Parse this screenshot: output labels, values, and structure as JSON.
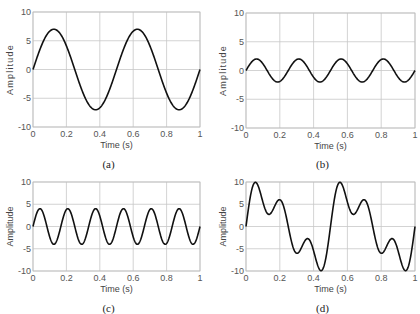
{
  "chart_data": [
    {
      "type": "line",
      "panel": "(a)",
      "caption": "(a)",
      "xlabel": "Time (s)",
      "ylabel": "Amplitude",
      "xlim": [
        0,
        1
      ],
      "ylim": [
        -10,
        10
      ],
      "xticks": [
        "0",
        "0.2",
        "0.4",
        "0.6",
        "0.8",
        "1"
      ],
      "yticks": [
        "10",
        "5",
        "0",
        "-5",
        "-10"
      ],
      "grid": true,
      "series": [
        {
          "name": "signal",
          "amplitude": 7,
          "frequency_hz": 2
        }
      ],
      "box": {
        "left": 33,
        "right": 200,
        "top": 12,
        "bottom": 127
      }
    },
    {
      "type": "line",
      "panel": "(b)",
      "caption": "(b)",
      "xlabel": "Time (s)",
      "ylabel": "Amplitude",
      "xlim": [
        0,
        1
      ],
      "ylim": [
        -10,
        10
      ],
      "xticks": [
        "0",
        "0.2",
        "0.4",
        "0.6",
        "0.8",
        "1"
      ],
      "yticks": [
        "10",
        "5",
        "0",
        "-5",
        "-10"
      ],
      "grid": true,
      "series": [
        {
          "name": "signal",
          "amplitude": 2,
          "frequency_hz": 4
        }
      ],
      "box": {
        "left": 246,
        "right": 415,
        "top": 13,
        "bottom": 128
      }
    },
    {
      "type": "line",
      "panel": "(c)",
      "caption": "(c)",
      "xlabel": "Time (s)",
      "ylabel": "Amplitude",
      "xlim": [
        0,
        1
      ],
      "ylim": [
        -10,
        10
      ],
      "xticks": [
        "0",
        "0.2",
        "0.4",
        "0.6",
        "0.8",
        "1"
      ],
      "yticks": [
        "10",
        "5",
        "0",
        "-5",
        "-10"
      ],
      "grid": true,
      "series": [
        {
          "name": "signal",
          "amplitude": 4,
          "frequency_hz": 6
        }
      ],
      "box": {
        "left": 33,
        "right": 200,
        "top": 182,
        "bottom": 271
      }
    },
    {
      "type": "line",
      "panel": "(d)",
      "caption": "(d)",
      "xlabel": "Time (s)",
      "ylabel": "Amplitude",
      "xlim": [
        0,
        1
      ],
      "ylim": [
        -10,
        10
      ],
      "xticks": [
        "0",
        "0.2",
        "0.4",
        "0.6",
        "0.8",
        "1"
      ],
      "yticks": [
        "10",
        "5",
        "0",
        "-5",
        "-10"
      ],
      "grid": true,
      "series": [
        {
          "name": "sum of (a)+(b)+(c)",
          "components": [
            {
              "amplitude": 7,
              "frequency_hz": 2
            },
            {
              "amplitude": 2,
              "frequency_hz": 4
            },
            {
              "amplitude": 4,
              "frequency_hz": 6
            }
          ]
        }
      ],
      "box": {
        "left": 246,
        "right": 415,
        "top": 182,
        "bottom": 271
      }
    }
  ]
}
